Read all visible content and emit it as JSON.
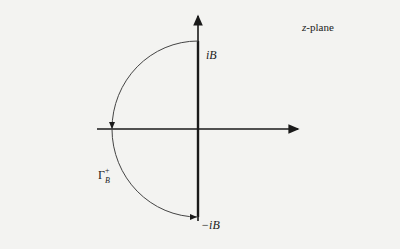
{
  "diagram": {
    "plane_label": "z-plane",
    "upper_point_label": "iB",
    "lower_point_label": "−iB",
    "contour_label": {
      "symbol": "Γ",
      "superscript": "+",
      "subscript": "B"
    },
    "colors": {
      "axis": "#1a1a1a",
      "contour": "#333333",
      "background": "#f3f3f1"
    }
  }
}
